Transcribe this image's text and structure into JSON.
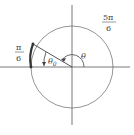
{
  "diagram": {
    "type": "unit-circle-angle",
    "labels": {
      "top_right_fraction": {
        "numerator": "5π",
        "denominator": "6"
      },
      "left_fraction": {
        "numerator": "π",
        "denominator": "6"
      },
      "theta": "θ",
      "theta_ref": "θ",
      "theta_ref_sub": "0"
    },
    "colors": {
      "stroke": "#555555",
      "arc_highlight": "#333333",
      "text": "#444444"
    }
  }
}
